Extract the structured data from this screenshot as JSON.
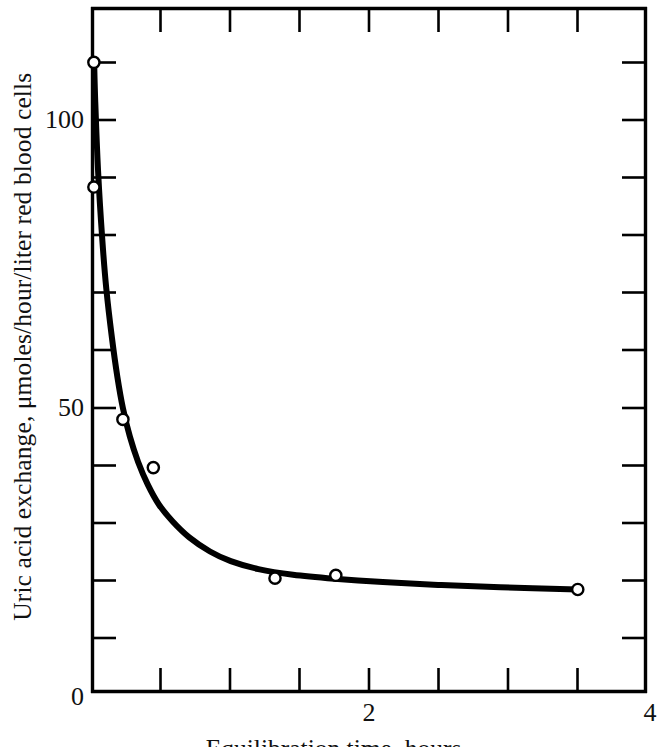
{
  "chart_data": {
    "type": "line",
    "title": "",
    "xlabel": "Equilibration time, hours",
    "ylabel": "Uric acid exchange, μmoles/hour/liter red blood cells",
    "xlim": [
      0,
      4
    ],
    "ylim": [
      0,
      120.5
    ],
    "grid": false,
    "legend": null,
    "x_tick_labels": [
      "0",
      "2",
      "4"
    ],
    "x_tick_values": [
      0,
      2,
      4
    ],
    "x_minor_tick_values": [
      0.5,
      1,
      1.5,
      2.5,
      3,
      3.5
    ],
    "y_tick_labels": [
      "50",
      "100"
    ],
    "y_tick_values": [
      50,
      100
    ],
    "y_minor_tick_values": [
      10,
      20,
      30,
      40,
      60,
      70,
      80,
      90,
      110
    ],
    "marker": "open-circle",
    "line_color": "#000000",
    "marker_color": "#000000",
    "marker_fill": "#ffffff",
    "series": [
      {
        "name": "Uric acid exchange",
        "x": [
          0.01,
          0.01,
          0.22,
          0.44,
          1.32,
          1.76,
          3.51
        ],
        "values": [
          111.0,
          89.0,
          48.0,
          39.5,
          20.0,
          20.5,
          18.0
        ]
      }
    ],
    "fitted_curve": {
      "description": "smooth decaying curve through the data points",
      "x": [
        0.012,
        0.02,
        0.04,
        0.07,
        0.1,
        0.14,
        0.18,
        0.22,
        0.27,
        0.33,
        0.4,
        0.48,
        0.58,
        0.7,
        0.85,
        1.0,
        1.2,
        1.45,
        1.75,
        2.1,
        2.5,
        2.95,
        3.51
      ],
      "y": [
        111.0,
        104.0,
        92.0,
        80.0,
        71.0,
        62.5,
        55.5,
        50.0,
        45.0,
        40.5,
        36.5,
        33.0,
        30.0,
        27.2,
        24.7,
        23.0,
        21.6,
        20.6,
        19.9,
        19.3,
        18.8,
        18.4,
        18.0
      ]
    }
  },
  "axis": {
    "frame_color": "#000000",
    "frame_label": "plot frame",
    "tick_label_0": "0",
    "tick_label_2": "2",
    "tick_label_4": "4",
    "tick_label_50": "50",
    "tick_label_100": "100"
  }
}
